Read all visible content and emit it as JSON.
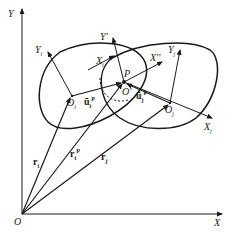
{
  "diagram": {
    "type": "coordinate-frames",
    "colors": {
      "stroke": "#1a1a1a",
      "background": "#ffffff"
    },
    "labels": {
      "Y": "Y",
      "X": "X",
      "O": "O",
      "Yi": "Y",
      "Yi_sub": "i",
      "Xi": "X",
      "Xi_sub": "i",
      "Oi": "O",
      "Oi_sub": "i",
      "ui": "ū",
      "ui_sub": "i",
      "ui_sup": "P",
      "Yprime": "Y'",
      "P": "P",
      "Oprime": "O'",
      "Xdouble": "X''",
      "Yj": "Y",
      "Yj_sub": "j",
      "uj": "ū",
      "uj_sub": "j",
      "uj_sup": "P",
      "Oj": "O",
      "Oj_sub": "j",
      "Xj": "X",
      "Xj_sub": "j",
      "ri": "r",
      "ri_sub": "i",
      "riP": "r",
      "riP_sub": "i",
      "riP_sup": "P",
      "rj": "r",
      "rj_sub": "j"
    }
  }
}
